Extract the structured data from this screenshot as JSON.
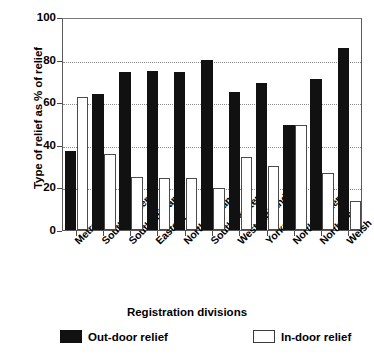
{
  "chart_data": {
    "type": "bar",
    "title": "",
    "xlabel": "Registration divisions",
    "ylabel": "Type of relief as % of relief",
    "ylim": [
      0,
      100
    ],
    "yticks": [
      0,
      20,
      40,
      60,
      80,
      100
    ],
    "grid": "horizontal-dotted",
    "legend_position": "bottom",
    "categories": [
      "Metropolis",
      "South-eastern",
      "South midland",
      "Eastern",
      "North midland",
      "South-western",
      "West midland",
      "Yorkshire",
      "North-western",
      "Northern",
      "Welsh"
    ],
    "series": [
      {
        "name": "Out-door relief",
        "color": "#111111",
        "values": [
          37,
          64,
          74,
          74.5,
          74,
          80,
          65,
          69,
          49.5,
          71,
          85.5
        ]
      },
      {
        "name": "In-door relief",
        "color": "#ffffff",
        "values": [
          62.5,
          35.5,
          25,
          24.5,
          24.5,
          19.5,
          34.5,
          30,
          49.5,
          27,
          13.5
        ]
      }
    ]
  },
  "legend": {
    "outdoor_label": "Out-door relief",
    "indoor_label": "In-door relief"
  }
}
